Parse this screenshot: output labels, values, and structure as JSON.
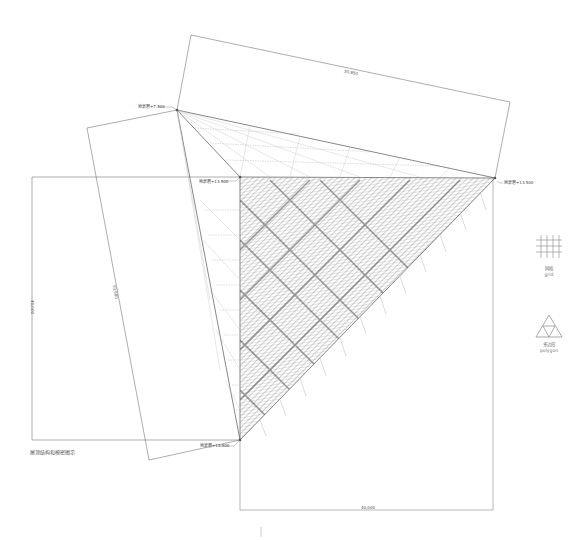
{
  "diagram": {
    "caption": "屋顶结构和模密图示",
    "elevation_labels": {
      "top_left": "地景層+7.500",
      "left_mid": "地景層+13.500",
      "right": "地景層+13.500",
      "bottom": "地景層+13.500"
    },
    "dimensions": {
      "top_slanted": "50,850",
      "left_vertical": "40,000",
      "left_slanted": "50,680",
      "bottom": "40,000"
    },
    "legend": [
      {
        "icon": "grid-icon",
        "label_cn": "网格",
        "label_en": "grid"
      },
      {
        "icon": "polygon-icon",
        "label_cn": "多边形",
        "label_en": "polygon"
      }
    ],
    "colors": {
      "line": "#666666",
      "light_line": "#aaaaaa",
      "hatch": "#7a7a7a",
      "background": "#ffffff"
    }
  }
}
